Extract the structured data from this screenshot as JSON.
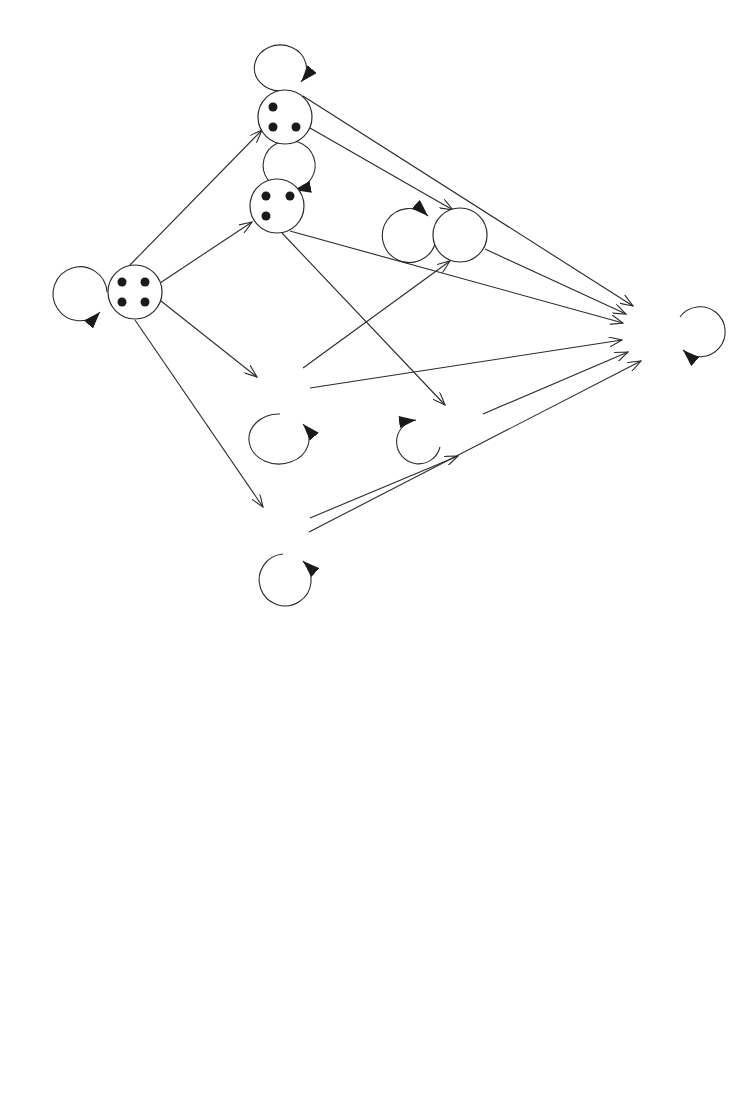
{
  "figure": {
    "part_a": {
      "caption": "(a)",
      "states": [
        {
          "id": "A",
          "failed_components_remaining": 4,
          "dots": 4,
          "self_loop": "1−4λΔt"
        },
        {
          "id": "B",
          "dots": 3,
          "self_loop": "1−3λΔt"
        },
        {
          "id": "C",
          "dots": 3,
          "self_loop": "1−3λΔt"
        },
        {
          "id": "D",
          "dots": 2,
          "self_loop": "1−2λΔt"
        },
        {
          "id": "E",
          "dots": 3,
          "self_loop": "1−3λΔt"
        },
        {
          "id": "G",
          "dots": 2,
          "self_loop": "1−2λΔt"
        },
        {
          "id": "H",
          "dots": 3,
          "self_loop": "1−3λΔt"
        },
        {
          "id": "F",
          "label": "F",
          "self_loop": "1"
        }
      ],
      "labels": {
        "loop_A": "1−4λΔt",
        "loop_B": "1−3λΔt",
        "loop_C_a": "1−3λΔt",
        "loop_C_b": "1−2λΔt",
        "loop_E": "1−3λΔt",
        "loop_G": "1−2λΔt",
        "loop_H": "1−3λΔt",
        "loop_F": "1",
        "A_B": "λΔt",
        "A_C": "λΔt",
        "A_E": "λΔt",
        "A_H": "λΔt",
        "B_D": "λΔt",
        "B_F": "2λΔt",
        "C_F": "2λΔt",
        "D_F": "2λΔt",
        "E_F": "2λΔt",
        "G_F": "2λΔt",
        "H_G": "λΔt",
        "H_F": "2λΛt",
        "F": "F"
      }
    },
    "part_b": {
      "caption": "(b)",
      "nodes": [
        {
          "id": "4",
          "label": "4",
          "self_loop": "1−4λΔt"
        },
        {
          "id": "3",
          "label": "3",
          "self_loop": "1−3λΔt"
        },
        {
          "id": "2",
          "label": "2",
          "self_loop": "1−2λΔt"
        },
        {
          "id": "F",
          "label": "F",
          "self_loop": "1"
        }
      ],
      "edges": [
        {
          "from": "4",
          "to": "3",
          "label": "4λΔt"
        },
        {
          "from": "3",
          "to": "F",
          "label": "2λΔt"
        },
        {
          "from": "3",
          "to": "2",
          "label": "λΔt"
        },
        {
          "from": "2",
          "to": "F",
          "label": "2λΔt"
        }
      ],
      "labels": {
        "loop_4": "1−4λΔt",
        "loop_3": "1−3λΔt",
        "loop_2": "1−2λΔt",
        "loop_F": "1",
        "e43": "4λΔt",
        "e3F": "2λΔt",
        "e32": "λΔt",
        "e2F": "2λΔt",
        "n4": "4",
        "n3": "3",
        "n2": "2",
        "nF": "F"
      }
    }
  }
}
